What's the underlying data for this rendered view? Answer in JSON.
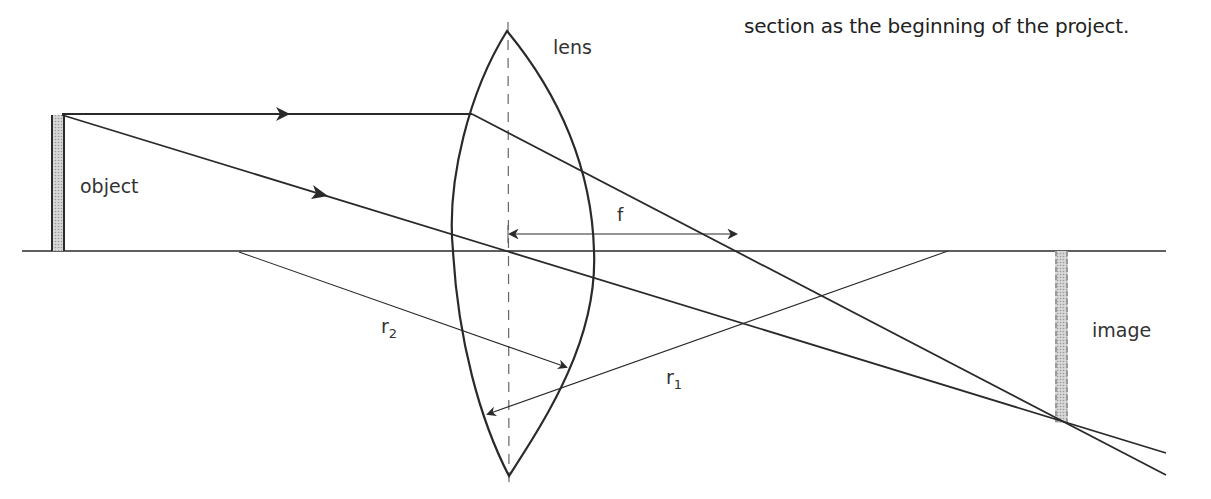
{
  "caption": "section as the beginning of the project.",
  "labels": {
    "lens": "lens",
    "object": "object",
    "image": "image",
    "focal_length": "f",
    "r1_main": "r",
    "r1_sub": "1",
    "r2_main": "r",
    "r2_sub": "2"
  },
  "colors": {
    "line": "#2a2a2a",
    "bar_fill": "#bdbdbd",
    "text": "#333333"
  }
}
